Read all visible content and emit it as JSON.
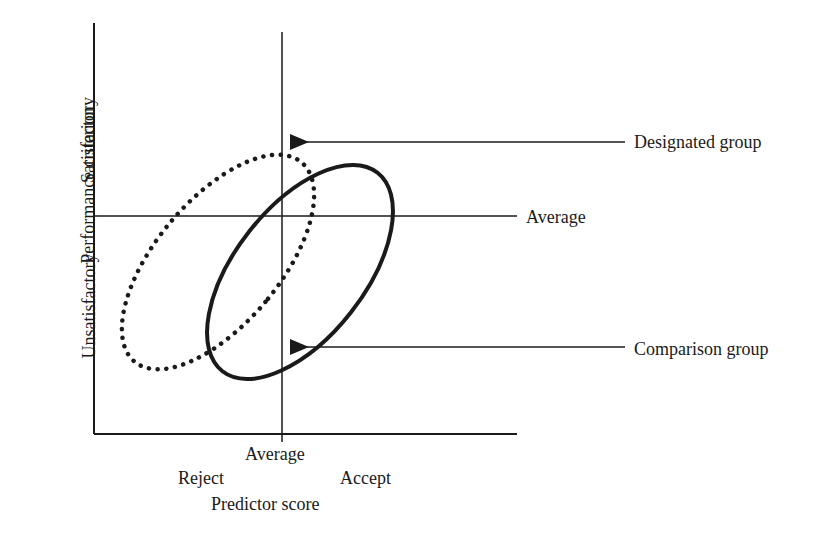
{
  "figure": {
    "type": "diagram",
    "y_axis": {
      "title": "Performance criterion",
      "upper_label": "Satisfactory",
      "lower_label": "Unsatisfactory"
    },
    "x_axis": {
      "title": "Predictor score",
      "left_label": "Reject",
      "right_label": "Accept",
      "center_label": "Average"
    },
    "horizontal_line_label": "Average",
    "callouts": {
      "designated": "Designated group",
      "comparison": "Comparison group"
    },
    "groups": [
      {
        "name": "Designated group",
        "line_style": "dotted"
      },
      {
        "name": "Comparison group",
        "line_style": "solid"
      }
    ],
    "colors": {
      "ink": "#1a1a1a",
      "background": "#ffffff"
    }
  }
}
